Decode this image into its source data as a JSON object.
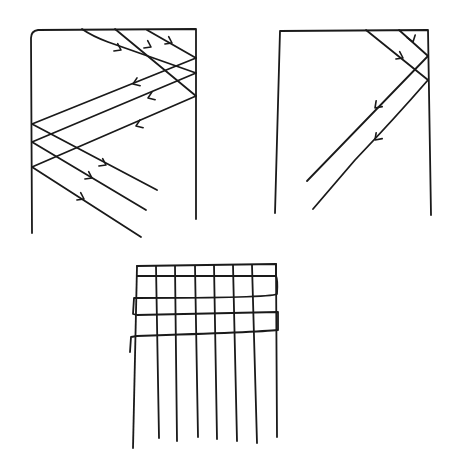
{
  "diagram": {
    "stroke_color": "#1a1a1a",
    "background": "#ffffff",
    "panels": [
      {
        "id": "left-frame",
        "frame_path": "M32,233 L31,38 Q31,31 38,30 L196,29 L196,219",
        "lines": [
          "M82,29 Q92,36 108,42 L196,73",
          "M115,29 L196,96",
          "M147,30 L196,58",
          "M196,58 L32,124",
          "M196,73 L32,142",
          "M196,96 L32,167",
          "M32,124 L157,190",
          "M32,142 L146,210",
          "M32,167 L141,237"
        ],
        "arrows": [
          {
            "x": 121,
            "y": 50,
            "dir": "right-down"
          },
          {
            "x": 151,
            "y": 47,
            "dir": "right-down"
          },
          {
            "x": 172,
            "y": 43,
            "dir": "right-down"
          },
          {
            "x": 133,
            "y": 84,
            "dir": "left"
          },
          {
            "x": 148,
            "y": 98,
            "dir": "left"
          },
          {
            "x": 136,
            "y": 126,
            "dir": "left"
          },
          {
            "x": 106,
            "y": 165,
            "dir": "right-down"
          },
          {
            "x": 92,
            "y": 178,
            "dir": "right-down"
          },
          {
            "x": 84,
            "y": 199,
            "dir": "right-down"
          }
        ]
      },
      {
        "id": "right-frame",
        "frame_path": "M275,213 L280,31 L428,30 L431,215",
        "lines": [
          "M366,30 L428,80",
          "M399,30 L428,56",
          "M428,56 L307,181",
          "M428,80 Q395,118 355,160 L313,209"
        ],
        "arrows": [
          {
            "x": 413,
            "y": 42,
            "dir": "down"
          },
          {
            "x": 403,
            "y": 58,
            "dir": "right-down"
          },
          {
            "x": 375,
            "y": 108,
            "dir": "left-down"
          },
          {
            "x": 375,
            "y": 140,
            "dir": "left-down"
          }
        ]
      },
      {
        "id": "weaving-grid",
        "weft_path": "M137,266 L276,264 L276,276 Q278,280 277,294 Q270,298 137,298 L134,298 L133,314 L137,315 L278,312 L278,330 Q260,332 137,336 L131,337 L130,352",
        "weft_top_row": "M137,276 L276,276",
        "warp_threads": [
          {
            "x_top": 137,
            "y_top": 266,
            "x_bottom": 133,
            "y_bottom": 448
          },
          {
            "x_top": 156,
            "y_top": 266,
            "x_bottom": 159,
            "y_bottom": 438
          },
          {
            "x_top": 175,
            "y_top": 266,
            "x_bottom": 177,
            "y_bottom": 441
          },
          {
            "x_top": 195,
            "y_top": 266,
            "x_bottom": 198,
            "y_bottom": 437
          },
          {
            "x_top": 214,
            "y_top": 265,
            "x_bottom": 217,
            "y_bottom": 439
          },
          {
            "x_top": 233,
            "y_top": 265,
            "x_bottom": 237,
            "y_bottom": 441
          },
          {
            "x_top": 252,
            "y_top": 265,
            "x_bottom": 257,
            "y_bottom": 443
          },
          {
            "x_top": 276,
            "y_top": 264,
            "x_bottom": 277,
            "y_bottom": 437
          }
        ]
      }
    ]
  }
}
